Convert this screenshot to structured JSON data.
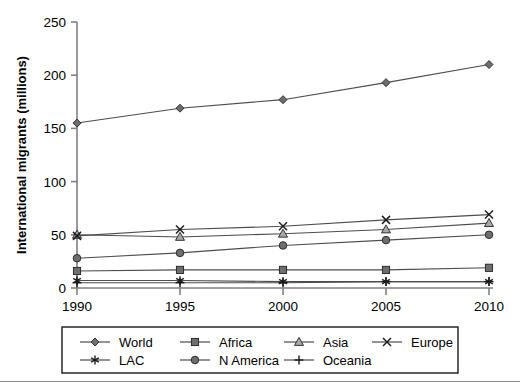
{
  "chart_data": {
    "type": "line",
    "title": "",
    "subtitle": "",
    "xlabel": "",
    "ylabel": "International migrants (millions)",
    "x": [
      1990,
      1995,
      2000,
      2005,
      2010
    ],
    "categories": [
      "1990",
      "1995",
      "2000",
      "2005",
      "2010"
    ],
    "xlim": [
      1990,
      2010
    ],
    "ylim": [
      0,
      250
    ],
    "yticks": [
      0,
      50,
      100,
      150,
      200,
      250
    ],
    "ytick_labels": [
      "0",
      "50",
      "100",
      "150",
      "200",
      "250"
    ],
    "xtick_labels": [
      "1990",
      "1995",
      "2000",
      "2005",
      "2010"
    ],
    "grid": false,
    "legend_position": "bottom",
    "legend_columns": 4,
    "series": [
      {
        "name": "World",
        "marker": "diamond",
        "values": [
          155,
          169,
          177,
          193,
          210
        ]
      },
      {
        "name": "Africa",
        "marker": "square",
        "values": [
          16,
          17,
          17,
          17,
          19
        ]
      },
      {
        "name": "Asia",
        "marker": "triangle",
        "values": [
          50,
          48,
          51,
          55,
          61
        ]
      },
      {
        "name": "Europe",
        "marker": "cross-x",
        "values": [
          49,
          55,
          58,
          64,
          69
        ]
      },
      {
        "name": "LAC",
        "marker": "asterisk",
        "values": [
          7,
          7,
          6,
          6,
          6
        ]
      },
      {
        "name": "N America",
        "marker": "circle",
        "values": [
          28,
          33,
          40,
          45,
          50
        ]
      },
      {
        "name": "Oceania",
        "marker": "plus",
        "values": [
          5,
          5,
          5,
          6,
          6
        ]
      }
    ],
    "colors": {
      "line": "#4d4d4d",
      "marker_fill": "#6e6e6e",
      "marker_stroke": "#222222",
      "axis": "#808080",
      "text": "#000000",
      "legend_border": "#1a1a1a"
    }
  },
  "legend": {
    "entries": [
      {
        "label": "World",
        "marker": "diamond"
      },
      {
        "label": "Africa",
        "marker": "square"
      },
      {
        "label": "Asia",
        "marker": "triangle"
      },
      {
        "label": "Europe",
        "marker": "cross-x"
      },
      {
        "label": "LAC",
        "marker": "asterisk"
      },
      {
        "label": "N America",
        "marker": "circle"
      },
      {
        "label": "Oceania",
        "marker": "plus"
      }
    ]
  }
}
